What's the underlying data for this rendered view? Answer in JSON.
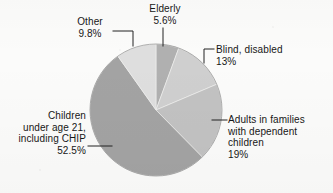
{
  "chart_data": {
    "type": "pie",
    "title": "",
    "subtitle": "",
    "xlabel": "",
    "ylabel": "",
    "grid": false,
    "legend_position": "none",
    "start_angle_deg": 0,
    "direction": "clockwise",
    "units": "percent",
    "categories": [
      "Elderly",
      "Blind, disabled",
      "Adults in families with dependent children",
      "Children under age 21, including CHIP",
      "Other"
    ],
    "values": [
      5.6,
      13,
      19,
      52.5,
      9.8
    ],
    "colors": [
      "#b0b0b0",
      "#cfcfcf",
      "#c2c2c2",
      "#a3a3a3",
      "#dedede"
    ],
    "slices": [
      {
        "id": "elderly",
        "name": "Elderly",
        "value": 5.6,
        "value_text": "5.6%",
        "label_text": "Elderly\n5.6%",
        "color": "#b0b0b0",
        "leader": "vertical"
      },
      {
        "id": "blind-disabled",
        "name": "Blind, disabled",
        "value": 13,
        "value_text": "13%",
        "label_text": "Blind, disabled\n13%",
        "color": "#cfcfcf",
        "leader": "elbow-down-left"
      },
      {
        "id": "adults-in-families",
        "name": "Adults in families with dependent children",
        "value": 19,
        "value_text": "19%",
        "label_text": "Adults in families\nwith dependent\nchildren\n19%",
        "color": "#c2c2c2",
        "leader": "horizontal-left"
      },
      {
        "id": "children-under-21",
        "name": "Children under age 21, including CHIP",
        "value": 52.5,
        "value_text": "52.5%",
        "label_text": "Children\nunder age 21,\nincluding CHIP\n52.5%",
        "color": "#a3a3a3",
        "leader": "horizontal-right"
      },
      {
        "id": "other",
        "name": "Other",
        "value": 9.8,
        "value_text": "9.8%",
        "label_text": "Other\n9.8%",
        "color": "#dedede",
        "leader": "elbow-right-down"
      }
    ]
  },
  "figure": {
    "background_color": "#fbfbfa",
    "outline_color": "#8f8f8f",
    "leader_color": "#222222",
    "text_color": "#171717"
  }
}
